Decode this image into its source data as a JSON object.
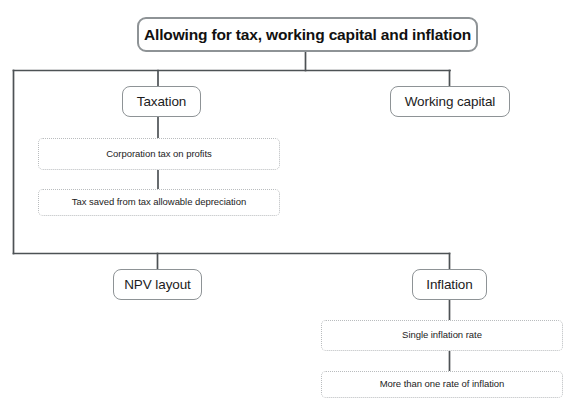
{
  "diagram": {
    "type": "tree-flowchart",
    "title_node": {
      "label": "Allowing for tax, working capital and inflation",
      "style": "rounded-thick",
      "x": 137,
      "y": 17,
      "w": 341,
      "h": 35
    },
    "nodes": [
      {
        "id": "taxation",
        "label": "Taxation",
        "style": "rounded-solid",
        "x": 122,
        "y": 86,
        "w": 79,
        "h": 31
      },
      {
        "id": "working-capital",
        "label": "Working capital",
        "style": "rounded-solid",
        "x": 390,
        "y": 86,
        "w": 120,
        "h": 31
      },
      {
        "id": "corporation-tax",
        "label": "Corporation tax on profits",
        "style": "dotted",
        "x": 38,
        "y": 138,
        "w": 242,
        "h": 32
      },
      {
        "id": "tax-saved",
        "label": "Tax saved from tax allowable depreciation",
        "style": "dotted",
        "x": 38,
        "y": 189,
        "w": 242,
        "h": 27
      },
      {
        "id": "npv-layout",
        "label": "NPV layout",
        "style": "rounded-solid",
        "x": 113,
        "y": 269,
        "w": 89,
        "h": 31
      },
      {
        "id": "inflation",
        "label": "Inflation",
        "style": "rounded-solid",
        "x": 412,
        "y": 269,
        "w": 75,
        "h": 31
      },
      {
        "id": "single-inflation-rate",
        "label": "Single inflation rate",
        "style": "dotted",
        "x": 321,
        "y": 320,
        "w": 242,
        "h": 31
      },
      {
        "id": "more-than-one-rate",
        "label": "More than one rate of inflation",
        "style": "dotted",
        "x": 321,
        "y": 371,
        "w": 242,
        "h": 27
      }
    ],
    "colors": {
      "node_border": "#8e9396",
      "dotted_border": "#b9bcbe",
      "connector": "#4d5255",
      "text": "#1a1a1a",
      "background": "#ffffff"
    }
  }
}
